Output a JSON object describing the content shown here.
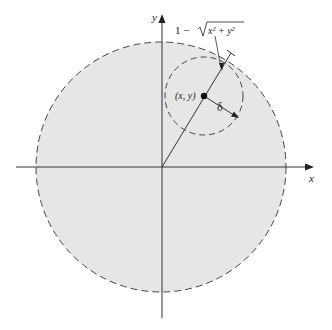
{
  "diagram": {
    "axes": {
      "x_label": "x",
      "y_label": "y"
    },
    "big_circle": {
      "cx": 161,
      "cy": 167,
      "r": 125,
      "fill": "#e6e6e6",
      "stroke": "#444444",
      "style": "dashed"
    },
    "small_circle": {
      "cx": 204,
      "cy": 96,
      "r": 39,
      "stroke": "#444444",
      "style": "dashed"
    },
    "point": {
      "label": "(x, y)",
      "cx": 203,
      "cy": 96
    },
    "radius_label": "δ",
    "distance_label": {
      "prefix": "1 − ",
      "radicand": "x² + y²"
    },
    "colors": {
      "fill": "#e6e6e6",
      "line": "#333333",
      "background": "#ffffff"
    }
  }
}
